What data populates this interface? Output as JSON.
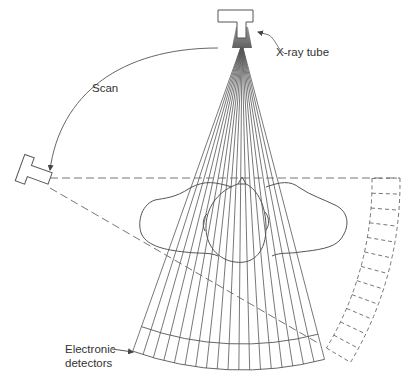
{
  "diagram": {
    "labels": {
      "xray_tube": "X-ray tube",
      "scan": "Scan",
      "detectors_line1": "Electronic",
      "detectors_line2": "detectors"
    },
    "colors": {
      "line": "#555555",
      "text": "#333333",
      "background": "#ffffff"
    },
    "fan": {
      "source": [
        242,
        44
      ],
      "ray_count": 19,
      "detector_left": [
        136,
        342
      ],
      "detector_right": [
        320,
        342
      ]
    },
    "components": [
      "x-ray tube",
      "fan beam",
      "patient head cross-section",
      "electronic detector arc",
      "rotated tube position (dashed)",
      "rotated detector arc (dashed)",
      "scan arrow"
    ]
  }
}
